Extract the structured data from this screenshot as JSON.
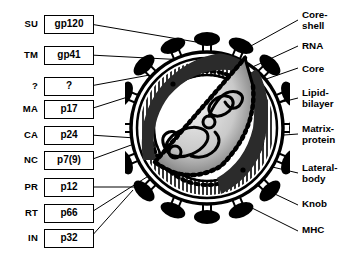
{
  "figure": {
    "line_color": "#000000",
    "background": "#ffffff"
  },
  "left_labels": [
    {
      "abbr": "SU",
      "box": "gp120",
      "y": 14
    },
    {
      "abbr": "TM",
      "box": "gp41",
      "y": 45
    },
    {
      "abbr": "?",
      "box": "?",
      "y": 76
    },
    {
      "abbr": "MA",
      "box": "p17",
      "y": 99
    },
    {
      "abbr": "CA",
      "box": "p24",
      "y": 125
    },
    {
      "abbr": "NC",
      "box": "p7(9)",
      "y": 150
    },
    {
      "abbr": "PR",
      "box": "p12",
      "y": 177
    },
    {
      "abbr": "RT",
      "box": "p66",
      "y": 203
    },
    {
      "abbr": "IN",
      "box": "p32",
      "y": 228
    }
  ],
  "right_labels": [
    {
      "text": "Core-\nshell",
      "y": 10
    },
    {
      "text": "RNA",
      "y": 41
    },
    {
      "text": "Core",
      "y": 64
    },
    {
      "text": "Lipid-\nbilayer",
      "y": 88
    },
    {
      "text": "Matrix-\nprotein",
      "y": 124
    },
    {
      "text": "Lateral-\nbody",
      "y": 163
    },
    {
      "text": "Knob",
      "y": 199
    },
    {
      "text": "MHC",
      "y": 225
    }
  ],
  "virion": {
    "knob_count": 16,
    "core_shape": "cone-shaped capsid",
    "rna_strands": "coiled nucleic acid inside core"
  }
}
